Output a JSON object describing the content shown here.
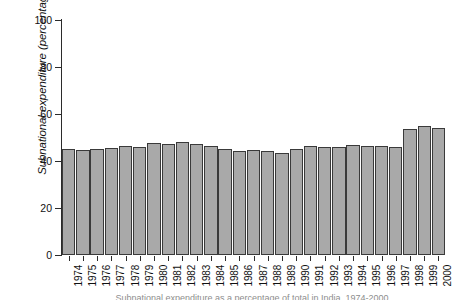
{
  "chart_data": {
    "type": "bar",
    "title": "",
    "xlabel": "",
    "ylabel": "Subnational expenditure (percentage of total)",
    "ylim": [
      0,
      100
    ],
    "yticks": [
      0,
      20,
      40,
      60,
      80,
      100
    ],
    "ytick_labels": [
      "0",
      "20",
      "40",
      "60",
      "80",
      "100"
    ],
    "grid": false,
    "legend": null,
    "bar_color": "#a9a9a9",
    "bar_edge_color": "#3a3a3a",
    "categories": [
      "1974",
      "1975",
      "1976",
      "1977",
      "1978",
      "1979",
      "1980",
      "1981",
      "1982",
      "1983",
      "1984",
      "1985",
      "1986",
      "1987",
      "1988",
      "1989",
      "1990",
      "1991",
      "1992",
      "1993",
      "1994",
      "1995",
      "1996",
      "1997",
      "1998",
      "1999",
      "2000"
    ],
    "values": [
      45.0,
      44.5,
      45.3,
      45.5,
      46.3,
      45.8,
      47.5,
      47.3,
      48.0,
      47.3,
      46.2,
      45.2,
      44.2,
      44.7,
      44.2,
      43.6,
      45.1,
      46.2,
      45.9,
      45.9,
      46.8,
      46.5,
      46.5,
      46.0,
      53.8,
      55.0,
      54.2
    ]
  },
  "caption": {
    "text": "Subnational expenditure as a percentage of total in India, 1974-2000"
  }
}
